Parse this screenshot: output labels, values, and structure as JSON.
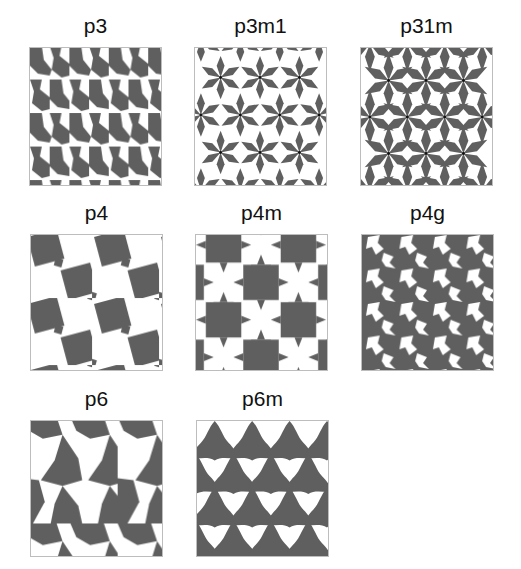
{
  "figure": {
    "title": "",
    "fill_color": "#5f5f5f",
    "background_color": "#ffffff",
    "border_color": "#bdbdbd",
    "panels": [
      {
        "label": "p3",
        "x": 29,
        "y": 47,
        "w": 133,
        "h": 139,
        "motif": "p3-tri-star"
      },
      {
        "label": "p3m1",
        "x": 194,
        "y": 47,
        "w": 133,
        "h": 139,
        "motif": "p3m1-six-petal"
      },
      {
        "label": "p31m",
        "x": 360,
        "y": 47,
        "w": 133,
        "h": 139,
        "motif": "p31m-six-petal"
      },
      {
        "label": "p4",
        "x": 30,
        "y": 234,
        "w": 133,
        "h": 137,
        "motif": "p4-rotated-squares"
      },
      {
        "label": "p4m",
        "x": 195,
        "y": 234,
        "w": 133,
        "h": 137,
        "motif": "p4m-star-checker"
      },
      {
        "label": "p4g",
        "x": 361,
        "y": 234,
        "w": 133,
        "h": 137,
        "motif": "p4g-pinwheel"
      },
      {
        "label": "p6",
        "x": 30,
        "y": 420,
        "w": 133,
        "h": 137,
        "motif": "p6-pinwheel-triangles"
      },
      {
        "label": "p6m",
        "x": 196,
        "y": 420,
        "w": 133,
        "h": 137,
        "motif": "p6m-trefoil"
      }
    ]
  }
}
